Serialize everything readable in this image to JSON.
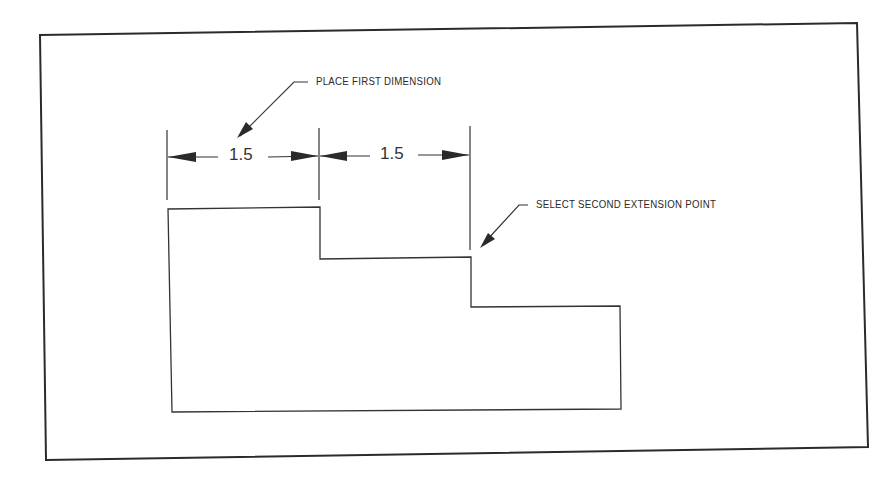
{
  "diagram": {
    "type": "technical-drawing",
    "frame": {
      "stroke": "#2b2b2b"
    },
    "shape": {
      "name": "stepped-profile",
      "stroke": "#333333",
      "points": [
        [
          168,
          208
        ],
        [
          320,
          207
        ],
        [
          320,
          259
        ],
        [
          471,
          257
        ],
        [
          471,
          307
        ],
        [
          620,
          306
        ],
        [
          621,
          409
        ],
        [
          172,
          412
        ]
      ]
    },
    "dimensions": [
      {
        "label": "1.5",
        "x1": 168,
        "x2": 319,
        "y": 156
      },
      {
        "label": "1.5",
        "x1": 319,
        "x2": 470,
        "y": 155
      }
    ],
    "callouts": [
      {
        "text": "PLACE FIRST DIMENSION"
      },
      {
        "text": "SELECT SECOND EXTENSION POINT"
      }
    ]
  }
}
